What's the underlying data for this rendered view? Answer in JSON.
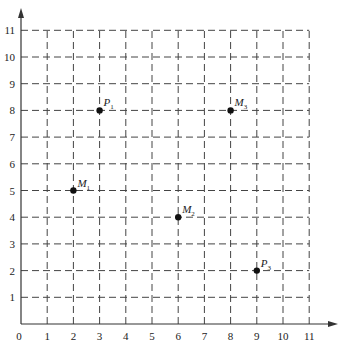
{
  "chart_data": {
    "type": "scatter",
    "title": "",
    "xlabel": "",
    "ylabel": "",
    "xlim": [
      0,
      11
    ],
    "ylim": [
      0,
      11
    ],
    "grid": true,
    "grid_style": "dashed",
    "x_ticks": [
      "0",
      "1",
      "2",
      "3",
      "4",
      "5",
      "6",
      "7",
      "8",
      "9",
      "10",
      "11"
    ],
    "y_ticks": [
      "1",
      "2",
      "3",
      "4",
      "5",
      "6",
      "7",
      "8",
      "9",
      "10",
      "11"
    ],
    "points": [
      {
        "label": "P",
        "sub": "1",
        "x": 3,
        "y": 8
      },
      {
        "label": "M",
        "sub": "3",
        "x": 8,
        "y": 8
      },
      {
        "label": "M",
        "sub": "1",
        "x": 2,
        "y": 5
      },
      {
        "label": "M",
        "sub": "2",
        "x": 6,
        "y": 4
      },
      {
        "label": "P",
        "sub": "3",
        "x": 9,
        "y": 2
      }
    ],
    "colors": {
      "axis": "#333333",
      "grid": "#444444",
      "point": "#111111"
    }
  },
  "layout": {
    "origin_x": 21,
    "origin_y": 324,
    "unit_x": 26.2,
    "unit_y": 26.7,
    "x_arrow_end": 338,
    "y_arrow_end": 8
  }
}
